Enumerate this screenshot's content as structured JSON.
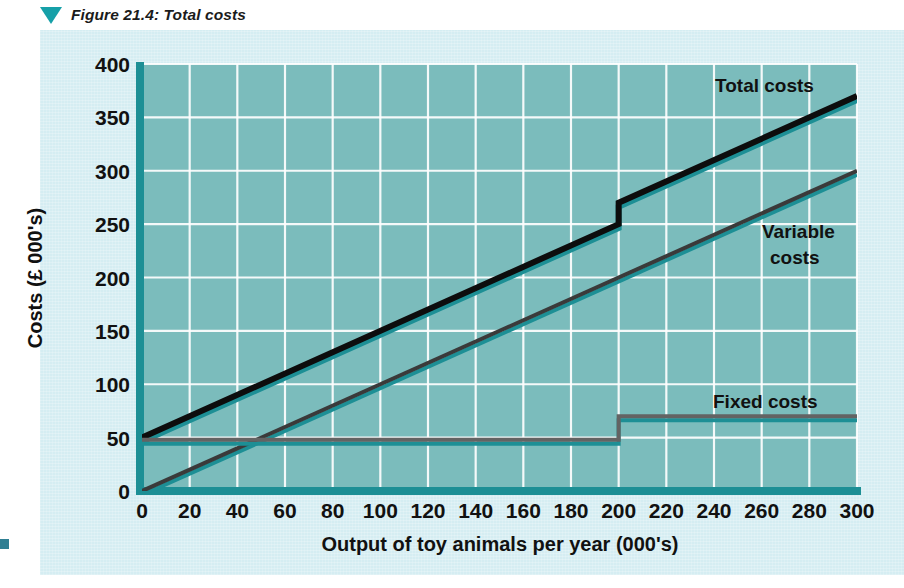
{
  "figure": {
    "caption": "Figure 21.4: Total costs",
    "marker_icon": "triangle-down-icon",
    "accent_color": "#16a0a8",
    "panel_color": "#d5edf2",
    "plot_color": "#6cb5b5",
    "grid_color": "#ffffff"
  },
  "chart_data": {
    "type": "line",
    "title": "Figure 21.4: Total costs",
    "xlabel": "Output of toy animals per year (000's)",
    "ylabel": "Costs (£ 000's)",
    "xlim": [
      0,
      300
    ],
    "ylim": [
      0,
      400
    ],
    "xticks": [
      0,
      20,
      40,
      60,
      80,
      100,
      120,
      140,
      160,
      180,
      200,
      220,
      240,
      260,
      280,
      300
    ],
    "yticks": [
      0,
      50,
      100,
      150,
      200,
      250,
      300,
      350,
      400
    ],
    "grid": true,
    "legend_position": "inline-annotations",
    "series": [
      {
        "name": "Total costs",
        "color": "#0d0d0d",
        "width": 6,
        "points": [
          [
            0,
            50
          ],
          [
            200,
            250
          ],
          [
            200,
            270
          ],
          [
            300,
            370
          ]
        ],
        "label_x": 246,
        "label_y": 368
      },
      {
        "name": "Variable costs",
        "color": "#3a3a3a",
        "width": 4,
        "points": [
          [
            0,
            0
          ],
          [
            300,
            300
          ]
        ],
        "label_x": 258,
        "label_y": 252
      },
      {
        "name": "Fixed costs",
        "color": "#636363",
        "width": 4,
        "points": [
          [
            0,
            48
          ],
          [
            200,
            48
          ],
          [
            200,
            70
          ],
          [
            300,
            70
          ]
        ],
        "label_x": 250,
        "label_y": 92
      }
    ],
    "annotations": [
      {
        "text": "Total costs",
        "x": 246,
        "y": 368
      },
      {
        "text": "Variable",
        "x": 258,
        "y": 256
      },
      {
        "text": "costs",
        "x": 262,
        "y": 234
      },
      {
        "text": "Fixed costs",
        "x": 248,
        "y": 92
      }
    ]
  },
  "labels": {
    "total_costs": "Total costs",
    "variable_costs_line1": "Variable",
    "variable_costs_line2": "costs",
    "fixed_costs": "Fixed costs",
    "x_axis_title": "Output of toy animals per year (000's)",
    "y_axis_title": "Costs (£ 000's)"
  }
}
